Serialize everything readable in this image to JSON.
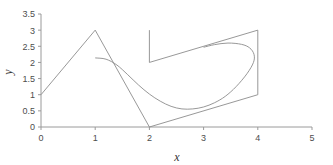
{
  "chart_data": {
    "type": "line",
    "title": "",
    "xlabel": "x",
    "ylabel": "y",
    "xlim": [
      0,
      5
    ],
    "ylim": [
      0,
      3.5
    ],
    "xticks": [
      "0",
      "1",
      "2",
      "3",
      "4",
      "5"
    ],
    "xtick_values": [
      0,
      1,
      2,
      3,
      4,
      5
    ],
    "yticks": [
      "0",
      "0.5",
      "1",
      "1.5",
      "2",
      "2.5",
      "3",
      "3.5"
    ],
    "ytick_values": [
      0,
      0.5,
      1,
      1.5,
      2,
      2.5,
      3,
      3.5
    ],
    "grid": false,
    "legend": null,
    "legend_position": "none",
    "line_color": "#8c8c8c",
    "axis_color": "#9a9a9a",
    "background_color": "#ffffff",
    "series": [
      {
        "name": "polyline-peak",
        "kind": "polyline",
        "points": [
          [
            0,
            1
          ],
          [
            1,
            3
          ],
          [
            2,
            0
          ],
          [
            4,
            1
          ]
        ]
      },
      {
        "name": "upper-bracket",
        "kind": "polyline",
        "points": [
          [
            2,
            3
          ],
          [
            2,
            2
          ],
          [
            4,
            3
          ],
          [
            4,
            1
          ]
        ]
      },
      {
        "name": "smooth-loop-curve",
        "kind": "curve",
        "points": [
          [
            1.0,
            2.14
          ],
          [
            1.2,
            2.1
          ],
          [
            1.4,
            1.92
          ],
          [
            1.6,
            1.62
          ],
          [
            1.8,
            1.3
          ],
          [
            2.0,
            1.02
          ],
          [
            2.2,
            0.8
          ],
          [
            2.4,
            0.64
          ],
          [
            2.6,
            0.56
          ],
          [
            2.8,
            0.56
          ],
          [
            3.0,
            0.62
          ],
          [
            3.2,
            0.75
          ],
          [
            3.4,
            0.95
          ],
          [
            3.6,
            1.25
          ],
          [
            3.8,
            1.65
          ],
          [
            3.92,
            2.0
          ],
          [
            3.93,
            2.25
          ],
          [
            3.85,
            2.45
          ],
          [
            3.7,
            2.56
          ],
          [
            3.45,
            2.6
          ],
          [
            3.2,
            2.55
          ],
          [
            3.0,
            2.47
          ]
        ]
      }
    ]
  },
  "axes": {
    "x_label": "x",
    "y_label": "y"
  }
}
